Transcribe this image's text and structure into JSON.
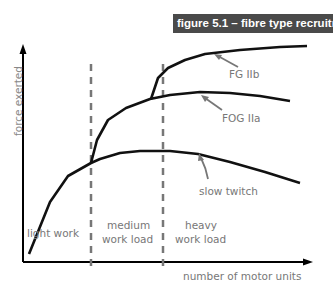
{
  "figure": {
    "title": "figure 5.1 – fibre type recruitment"
  },
  "axes": {
    "ylabel": "force exerted",
    "xlabel": "number of motor units"
  },
  "zones": [
    {
      "label": "light work"
    },
    {
      "label_line1": "medium",
      "label_line2": "work load"
    },
    {
      "label_line1": "heavy",
      "label_line2": "work load"
    }
  ],
  "curves": [
    {
      "label": "FG IIb"
    },
    {
      "label": "FOG IIa"
    },
    {
      "label": "slow twitch"
    }
  ],
  "colors": {
    "title_bg": "#4a4a4a",
    "curve": "#111111",
    "divider": "#777777",
    "text": "#777777"
  }
}
